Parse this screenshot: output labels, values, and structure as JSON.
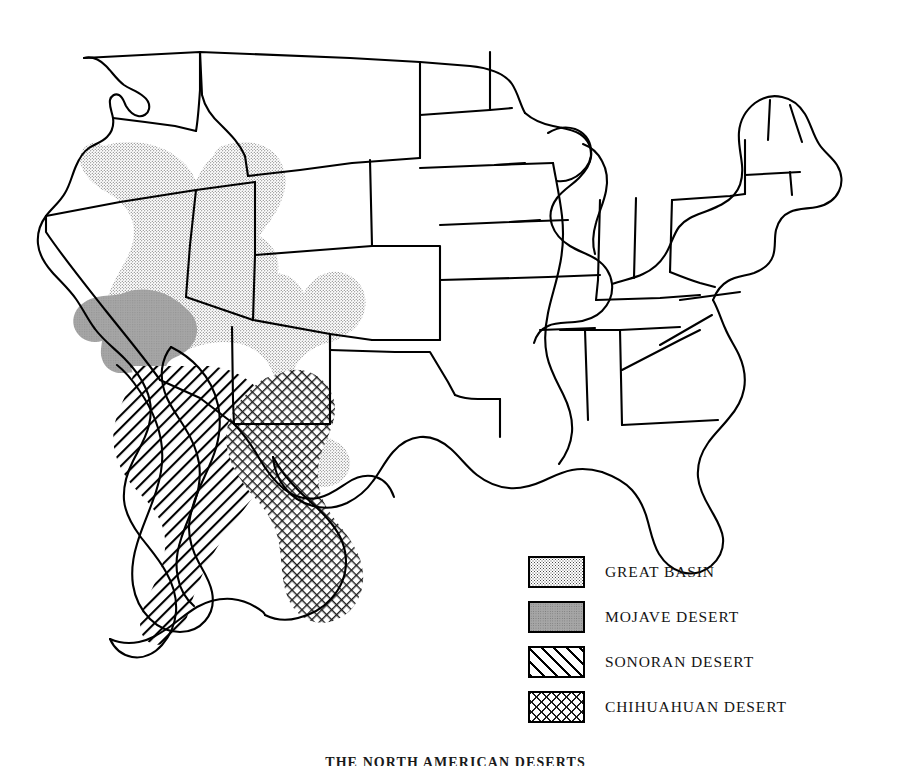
{
  "figure": {
    "caption": "THE NORTH AMERICAN DESERTS",
    "background_color": "#ffffff",
    "outline_color": "#000000"
  },
  "legend": {
    "items": [
      {
        "label": "GREAT BASIN",
        "pattern": "stipple-dots",
        "color": "#4a4a4a",
        "swatch_name": "legend-swatch-great-basin"
      },
      {
        "label": "MOJAVE DESERT",
        "pattern": "solid-gray",
        "color": "#a6a6a6",
        "swatch_name": "legend-swatch-mojave-desert"
      },
      {
        "label": "SONORAN DESERT",
        "pattern": "diagonal-hatch",
        "color": "#000000",
        "swatch_name": "legend-swatch-sonoran-desert"
      },
      {
        "label": "CHIHUAHUAN DESERT",
        "pattern": "cross-hatch",
        "color": "#1a1a1a",
        "swatch_name": "legend-swatch-chihuahuan-desert"
      }
    ]
  },
  "map": {
    "title": "North American Deserts",
    "regions": [
      "Great Basin",
      "Mojave Desert",
      "Sonoran Desert",
      "Chihuahuan Desert"
    ]
  }
}
